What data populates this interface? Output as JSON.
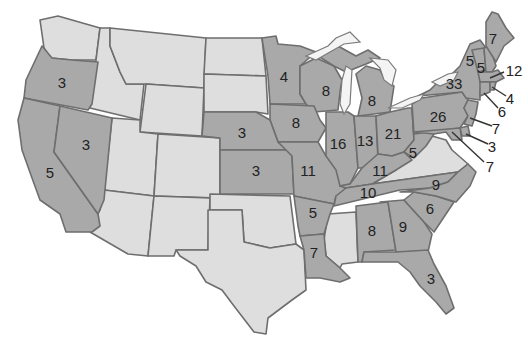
{
  "map": {
    "subject": "United States (contiguous) - states with numeric labels",
    "colors": {
      "highlighted": "#a9a9a9",
      "other": "#dedede",
      "border": "#6e6e6e",
      "background": "#ffffff"
    },
    "labeled_states": [
      {
        "state": "Oregon",
        "value": "3"
      },
      {
        "state": "Nevada",
        "value": "3"
      },
      {
        "state": "California",
        "value": "5"
      },
      {
        "state": "Minnesota",
        "value": "4"
      },
      {
        "state": "Wisconsin",
        "value": "8"
      },
      {
        "state": "Iowa",
        "value": "8"
      },
      {
        "state": "Nebraska",
        "value": "3"
      },
      {
        "state": "Kansas",
        "value": "3"
      },
      {
        "state": "Missouri",
        "value": "11"
      },
      {
        "state": "Illinois",
        "value": "16"
      },
      {
        "state": "Michigan",
        "value": "8"
      },
      {
        "state": "Indiana",
        "value": "13"
      },
      {
        "state": "Ohio",
        "value": "21"
      },
      {
        "state": "Kentucky",
        "value": "11"
      },
      {
        "state": "Tennessee",
        "value": "10"
      },
      {
        "state": "Arkansas",
        "value": "5"
      },
      {
        "state": "Louisiana",
        "value": "7"
      },
      {
        "state": "Alabama",
        "value": "8"
      },
      {
        "state": "Georgia",
        "value": "9"
      },
      {
        "state": "Florida",
        "value": "3"
      },
      {
        "state": "South Carolina",
        "value": "6"
      },
      {
        "state": "North Carolina",
        "value": "9"
      },
      {
        "state": "West Virginia",
        "value": "5"
      },
      {
        "state": "Pennsylvania",
        "value": "26"
      },
      {
        "state": "New York",
        "value": "33"
      },
      {
        "state": "Vermont",
        "value": "5"
      },
      {
        "state": "New Hampshire",
        "value": "5"
      },
      {
        "state": "Maine",
        "value": "7"
      },
      {
        "state": "Massachusetts",
        "value": "12"
      },
      {
        "state": "Rhode Island",
        "value": "4"
      },
      {
        "state": "Connecticut",
        "value": "6"
      },
      {
        "state": "New Jersey",
        "value": "7"
      },
      {
        "state": "Delaware",
        "value": "3"
      },
      {
        "state": "Maryland",
        "value": "7"
      }
    ],
    "unlabeled_states": [
      "Washington",
      "Idaho",
      "Montana",
      "Wyoming",
      "Utah",
      "Colorado",
      "Arizona",
      "New Mexico",
      "North Dakota",
      "South Dakota",
      "Oklahoma",
      "Texas",
      "Mississippi",
      "Virginia"
    ]
  }
}
